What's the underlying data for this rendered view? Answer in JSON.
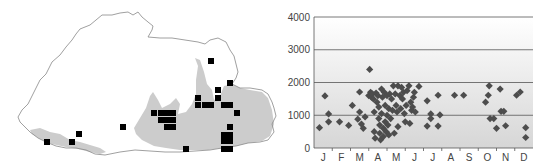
{
  "map": {
    "outline_color": "#888888",
    "range_fill_color": "#cccccc",
    "marker_color": "#000000",
    "outline": [
      [
        18,
        117
      ],
      [
        22,
        110
      ],
      [
        28,
        104
      ],
      [
        34,
        92
      ],
      [
        40,
        80
      ],
      [
        46,
        74
      ],
      [
        52,
        62
      ],
      [
        60,
        55
      ],
      [
        66,
        47
      ],
      [
        72,
        40
      ],
      [
        76,
        34
      ],
      [
        80,
        29
      ],
      [
        90,
        25
      ],
      [
        96,
        20
      ],
      [
        102,
        15
      ],
      [
        112,
        15
      ],
      [
        120,
        13
      ],
      [
        128,
        12
      ],
      [
        133,
        15
      ],
      [
        138,
        12
      ],
      [
        142,
        17
      ],
      [
        148,
        22
      ],
      [
        153,
        26
      ],
      [
        152,
        30
      ],
      [
        148,
        37
      ],
      [
        160,
        38
      ],
      [
        172,
        38
      ],
      [
        185,
        40
      ],
      [
        198,
        42
      ],
      [
        205,
        44
      ],
      [
        210,
        40
      ],
      [
        218,
        38
      ],
      [
        226,
        42
      ],
      [
        230,
        50
      ],
      [
        234,
        56
      ],
      [
        236,
        64
      ],
      [
        238,
        72
      ],
      [
        236,
        78
      ],
      [
        232,
        84
      ],
      [
        240,
        88
      ],
      [
        250,
        88
      ],
      [
        262,
        90
      ],
      [
        268,
        94
      ],
      [
        272,
        102
      ],
      [
        274,
        108
      ],
      [
        276,
        116
      ],
      [
        272,
        124
      ],
      [
        274,
        132
      ],
      [
        268,
        140
      ],
      [
        260,
        142
      ],
      [
        248,
        143
      ],
      [
        236,
        146
      ],
      [
        222,
        148
      ],
      [
        210,
        150
      ],
      [
        195,
        151
      ],
      [
        180,
        152
      ],
      [
        165,
        152
      ],
      [
        150,
        151
      ],
      [
        135,
        150
      ],
      [
        120,
        152
      ],
      [
        105,
        155
      ],
      [
        95,
        154
      ],
      [
        86,
        150
      ],
      [
        76,
        148
      ],
      [
        66,
        148
      ],
      [
        56,
        146
      ],
      [
        46,
        142
      ],
      [
        38,
        138
      ],
      [
        30,
        132
      ],
      [
        24,
        126
      ],
      [
        20,
        122
      ],
      [
        18,
        117
      ]
    ],
    "range_shapes": [
      [
        [
          30,
          130
        ],
        [
          40,
          128
        ],
        [
          50,
          132
        ],
        [
          60,
          134
        ],
        [
          70,
          140
        ],
        [
          80,
          142
        ],
        [
          90,
          145
        ],
        [
          100,
          148
        ],
        [
          106,
          152
        ],
        [
          100,
          154
        ],
        [
          90,
          152
        ],
        [
          78,
          149
        ],
        [
          66,
          147
        ],
        [
          52,
          144
        ],
        [
          40,
          139
        ],
        [
          32,
          134
        ]
      ],
      [
        [
          134,
          128
        ],
        [
          140,
          118
        ],
        [
          146,
          108
        ],
        [
          150,
          96
        ],
        [
          153,
          92
        ],
        [
          158,
          100
        ],
        [
          162,
          108
        ],
        [
          170,
          104
        ],
        [
          176,
          98
        ],
        [
          180,
          104
        ],
        [
          178,
          114
        ],
        [
          186,
          112
        ],
        [
          192,
          104
        ],
        [
          196,
          94
        ],
        [
          196,
          80
        ],
        [
          198,
          66
        ],
        [
          195,
          58
        ],
        [
          200,
          60
        ],
        [
          204,
          72
        ],
        [
          207,
          84
        ],
        [
          212,
          90
        ],
        [
          214,
          100
        ],
        [
          220,
          96
        ],
        [
          224,
          86
        ],
        [
          232,
          84
        ],
        [
          240,
          88
        ],
        [
          250,
          90
        ],
        [
          262,
          92
        ],
        [
          268,
          98
        ],
        [
          272,
          110
        ],
        [
          274,
          124
        ],
        [
          270,
          136
        ],
        [
          262,
          141
        ],
        [
          248,
          143
        ],
        [
          236,
          146
        ],
        [
          222,
          148
        ],
        [
          208,
          150
        ],
        [
          195,
          150
        ],
        [
          180,
          150
        ],
        [
          166,
          148
        ],
        [
          154,
          146
        ],
        [
          142,
          140
        ],
        [
          136,
          134
        ]
      ]
    ],
    "markers": [
      [
        211,
        61
      ],
      [
        230,
        83
      ],
      [
        218,
        90
      ],
      [
        218,
        98
      ],
      [
        198,
        98
      ],
      [
        198,
        105
      ],
      [
        205,
        105
      ],
      [
        211,
        105
      ],
      [
        224,
        105
      ],
      [
        230,
        105
      ],
      [
        237,
        113
      ],
      [
        154,
        113
      ],
      [
        161,
        113
      ],
      [
        167,
        113
      ],
      [
        173,
        113
      ],
      [
        161,
        120
      ],
      [
        167,
        120
      ],
      [
        173,
        120
      ],
      [
        167,
        127
      ],
      [
        173,
        127
      ],
      [
        123,
        127
      ],
      [
        230,
        127
      ],
      [
        224,
        135
      ],
      [
        230,
        135
      ],
      [
        224,
        141
      ],
      [
        230,
        141
      ],
      [
        224,
        149
      ],
      [
        230,
        149
      ],
      [
        186,
        149
      ],
      [
        79,
        134
      ],
      [
        72,
        142
      ],
      [
        47,
        142
      ]
    ],
    "marker_size": 6
  },
  "chart_data": {
    "type": "scatter",
    "title": "",
    "xlabel": "",
    "ylabel": "",
    "categories": [
      "J",
      "F",
      "M",
      "A",
      "M",
      "J",
      "J",
      "A",
      "S",
      "O",
      "N",
      "D"
    ],
    "yticks": [
      0,
      1000,
      2000,
      3000,
      4000
    ],
    "ylim": [
      0,
      4000
    ],
    "xlim": [
      0,
      12
    ],
    "grid": {
      "horizontal": true,
      "lines_at": [
        1000,
        2000,
        3000,
        4000
      ]
    },
    "marker": "diamond",
    "marker_color": "#4d4d4d",
    "background_gradient": [
      "#ffffff",
      "#d6d6d6"
    ],
    "series": [
      {
        "name": "records",
        "points": [
          [
            0.3,
            620
          ],
          [
            0.6,
            1590
          ],
          [
            0.8,
            1040
          ],
          [
            0.8,
            800
          ],
          [
            1.4,
            800
          ],
          [
            1.9,
            690
          ],
          [
            2.1,
            1300
          ],
          [
            2.5,
            1710
          ],
          [
            2.5,
            1100
          ],
          [
            2.4,
            880
          ],
          [
            2.6,
            730
          ],
          [
            2.7,
            600
          ],
          [
            2.8,
            950
          ],
          [
            3.0,
            1600
          ],
          [
            3.05,
            2400
          ],
          [
            3.1,
            1700
          ],
          [
            3.15,
            1550
          ],
          [
            3.2,
            1650
          ],
          [
            3.25,
            1500
          ],
          [
            3.3,
            1100
          ],
          [
            3.3,
            500
          ],
          [
            3.35,
            300
          ],
          [
            3.4,
            1680
          ],
          [
            3.45,
            1400
          ],
          [
            3.5,
            1600
          ],
          [
            3.55,
            1250
          ],
          [
            3.55,
            900
          ],
          [
            3.6,
            700
          ],
          [
            3.6,
            450
          ],
          [
            3.65,
            250
          ],
          [
            3.7,
            1800
          ],
          [
            3.7,
            1050
          ],
          [
            3.75,
            1550
          ],
          [
            3.8,
            600
          ],
          [
            3.8,
            350
          ],
          [
            3.85,
            1700
          ],
          [
            3.9,
            1300
          ],
          [
            3.9,
            800
          ],
          [
            3.95,
            500
          ],
          [
            4.0,
            1600
          ],
          [
            4.0,
            1000
          ],
          [
            4.05,
            700
          ],
          [
            4.1,
            1200
          ],
          [
            4.1,
            400
          ],
          [
            4.15,
            1650
          ],
          [
            4.2,
            900
          ],
          [
            4.25,
            1500
          ],
          [
            4.3,
            1150
          ],
          [
            4.35,
            1900
          ],
          [
            4.4,
            450
          ],
          [
            4.45,
            1650
          ],
          [
            4.5,
            1300
          ],
          [
            4.6,
            650
          ],
          [
            4.55,
            1100
          ],
          [
            4.6,
            1900
          ],
          [
            4.7,
            1600
          ],
          [
            4.75,
            1200
          ],
          [
            4.8,
            1850
          ],
          [
            4.85,
            1500
          ],
          [
            4.9,
            1700
          ],
          [
            4.95,
            1050
          ],
          [
            5.0,
            800
          ],
          [
            5.05,
            1300
          ],
          [
            5.1,
            1750
          ],
          [
            5.2,
            1900
          ],
          [
            5.25,
            750
          ],
          [
            5.3,
            1400
          ],
          [
            5.35,
            1150
          ],
          [
            5.4,
            1250
          ],
          [
            5.45,
            1550
          ],
          [
            5.5,
            1700
          ],
          [
            5.55,
            1100
          ],
          [
            5.75,
            1880
          ],
          [
            6.2,
            1440
          ],
          [
            6.2,
            670
          ],
          [
            6.4,
            1040
          ],
          [
            6.4,
            900
          ],
          [
            6.8,
            1610
          ],
          [
            6.8,
            670
          ],
          [
            6.9,
            1010
          ],
          [
            7.7,
            1610
          ],
          [
            8.2,
            1610
          ],
          [
            9.4,
            1400
          ],
          [
            9.6,
            1900
          ],
          [
            9.55,
            1610
          ],
          [
            9.65,
            900
          ],
          [
            9.85,
            900
          ],
          [
            10.0,
            600
          ],
          [
            10.2,
            1800
          ],
          [
            10.25,
            1120
          ],
          [
            10.4,
            1120
          ],
          [
            10.5,
            680
          ],
          [
            11.1,
            1610
          ],
          [
            11.3,
            1710
          ],
          [
            11.6,
            620
          ],
          [
            11.6,
            320
          ]
        ]
      }
    ]
  }
}
